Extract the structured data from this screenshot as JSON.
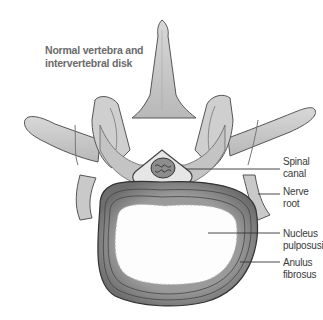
{
  "figure": {
    "title_line1": "Normal vertebra and",
    "title_line2": "intervertebral disk"
  },
  "labels": [
    {
      "line1": "Spinal",
      "line2": "canal"
    },
    {
      "line1": "Nerve",
      "line2": "root"
    },
    {
      "line1": "Nucleus",
      "line2": "pulposusi"
    },
    {
      "line1": "Anulus",
      "line2": "fibrosus"
    }
  ]
}
